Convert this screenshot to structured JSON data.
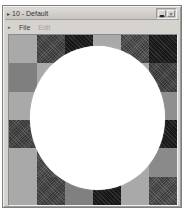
{
  "window": {
    "title": "10 - Default",
    "title_icon": "▸",
    "controls": {
      "minimize_label": "▃",
      "close_label": "×"
    }
  },
  "menubar": {
    "marker": "▸",
    "items": [
      {
        "label": "File",
        "disabled": false
      },
      {
        "label": "Edit",
        "disabled": true
      }
    ]
  },
  "canvas": {
    "background_light": "#a9a9a9",
    "circle_color": "#ffffff",
    "circle": {
      "left": 21,
      "top": 11,
      "width": 135,
      "height": 144
    },
    "columns": 6,
    "rows": 6,
    "cell_colors": [
      [
        "#a9a9a9",
        "#4f4f4f",
        "#1c1c1c",
        "#a9a9a9",
        "#565656",
        "#1e1e1e"
      ],
      [
        "#7f7f7f",
        "#a9a9a9",
        "#8a8a8a",
        "#4f4f4f",
        "#a9a9a9",
        "#4a4a4a"
      ],
      [
        "#a9a9a9",
        "#222222",
        "#777777",
        "#a9a9a9",
        "#555555",
        "#8f8f8f"
      ],
      [
        "#4d4d4d",
        "#a9a9a9",
        "#333333",
        "#888888",
        "#a9a9a9",
        "#1e1e1e"
      ],
      [
        "#a9a9a9",
        "#555555",
        "#999999",
        "#444444",
        "#a9a9a9",
        "#8a8a8a"
      ],
      [
        "#a9a9a9",
        "#4e4e4e",
        "#808080",
        "#1c1c1c",
        "#a9a9a9",
        "#555555"
      ]
    ]
  }
}
